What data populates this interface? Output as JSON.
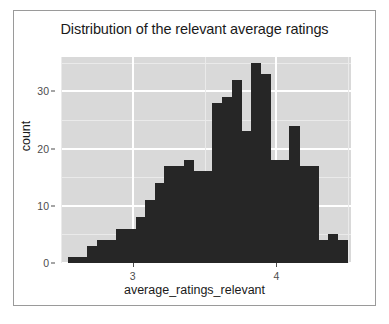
{
  "chart_data": {
    "type": "bar",
    "subtype": "histogram",
    "title": "Distribution of the relevant average ratings",
    "xlabel": "average_ratings_relevant",
    "ylabel": "count",
    "grid": true,
    "legend": null,
    "legend_position": "none",
    "xlim": [
      2.5,
      4.52
    ],
    "ylim": [
      0,
      36
    ],
    "xticks": [
      3,
      4
    ],
    "xtick_labels": [
      "3",
      "4"
    ],
    "yticks": [
      0,
      10,
      20,
      30
    ],
    "ytick_labels": [
      "0",
      "10",
      "20",
      "30"
    ],
    "bin_width": 0.067,
    "bin_starts": [
      2.55,
      2.617,
      2.684,
      2.751,
      2.818,
      2.885,
      2.952,
      3.019,
      3.086,
      3.153,
      3.22,
      3.287,
      3.354,
      3.421,
      3.488,
      3.555,
      3.622,
      3.689,
      3.756,
      3.823,
      3.89,
      3.957,
      4.024,
      4.091,
      4.158,
      4.225,
      4.292,
      4.359,
      4.426
    ],
    "bin_centers": [
      2.58,
      2.65,
      2.72,
      2.78,
      2.85,
      2.92,
      2.99,
      3.05,
      3.12,
      3.19,
      3.25,
      3.32,
      3.39,
      3.45,
      3.52,
      3.59,
      3.66,
      3.72,
      3.79,
      3.86,
      3.92,
      3.99,
      4.06,
      4.12,
      4.19,
      4.26,
      4.33,
      4.39,
      4.46
    ],
    "counts": [
      1,
      1,
      3,
      4,
      4,
      6,
      6,
      8,
      11,
      14,
      17,
      17,
      18,
      16,
      16,
      28,
      29,
      32,
      23,
      35,
      33,
      18,
      18,
      24,
      17,
      17,
      4,
      5,
      4
    ],
    "bar_color": "#262626",
    "panel_color": "#d9d9d9",
    "gridline_color": "#ffffff"
  },
  "figure": {
    "background": "#ffffff",
    "border_color": "#9a9a9a"
  }
}
